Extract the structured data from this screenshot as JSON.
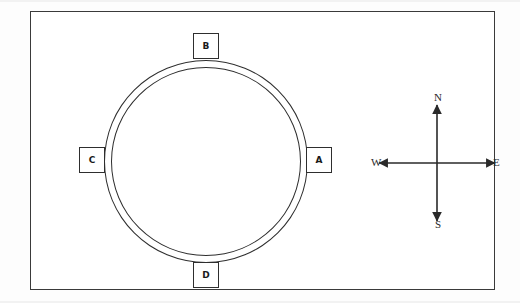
{
  "figure": {
    "name": "circular-route-diagram-with-compass",
    "background_color": "#ffffff",
    "line_color": "#2e2e2e",
    "frame_color": "#3a3a3a"
  },
  "ring": {
    "description": "double-line circular track",
    "center_x": 175,
    "center_y": 150,
    "outer_radius": 102,
    "inner_radius": 95
  },
  "stations": [
    {
      "id": "a",
      "label": "A",
      "position": "east",
      "x": 275,
      "y": 135
    },
    {
      "id": "b",
      "label": "B",
      "position": "north",
      "x": 162,
      "y": 21
    },
    {
      "id": "c",
      "label": "C",
      "position": "west",
      "x": 48,
      "y": 135
    },
    {
      "id": "d",
      "label": "D",
      "position": "south",
      "x": 162,
      "y": 250
    }
  ],
  "compass": {
    "name": "compass-rose",
    "center_x": 406,
    "center_y": 151,
    "arm_length": 58,
    "labels": {
      "north": "N",
      "south": "S",
      "east": "E",
      "west": "W"
    }
  }
}
